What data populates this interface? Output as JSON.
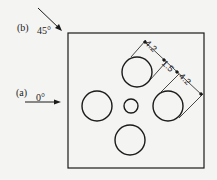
{
  "diagram": {
    "type": "technical-drawing",
    "incidences": [
      {
        "id": "a",
        "label": "(a)",
        "angle": "0°"
      },
      {
        "id": "b",
        "label": "(b)",
        "angle": "45°"
      }
    ],
    "dimensions": [
      {
        "label": "4.2"
      },
      {
        "label": "1.5"
      },
      {
        "label": "4.2"
      }
    ],
    "holes": [
      {
        "name": "top",
        "size": "large"
      },
      {
        "name": "left",
        "size": "large"
      },
      {
        "name": "center",
        "size": "small"
      },
      {
        "name": "right",
        "size": "large"
      },
      {
        "name": "bottom",
        "size": "large"
      }
    ],
    "colors": {
      "line": "#1a1a1a",
      "background": "#f4f4f2"
    }
  }
}
